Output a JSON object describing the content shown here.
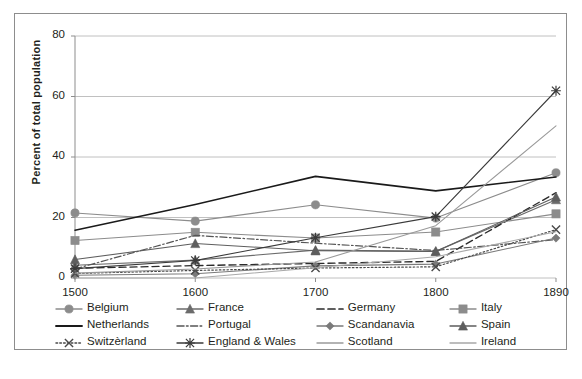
{
  "chart_data": {
    "type": "line",
    "title": "",
    "subtitle": "",
    "xlabel": "",
    "ylabel": "Percent of total population",
    "x": [
      1500,
      1600,
      1700,
      1800,
      1890
    ],
    "x_tick_labels": [
      "1500",
      "1600",
      "1700",
      "1800",
      "1890"
    ],
    "y_tick_labels": [
      "0",
      "20",
      "40",
      "60",
      "80"
    ],
    "y_ticks": [
      0,
      20,
      40,
      60,
      80
    ],
    "ylim": [
      0,
      80
    ],
    "grid": "horizontal",
    "legend_position": "bottom",
    "series": [
      {
        "name": "Belgium",
        "values": [
          21.5,
          18.8,
          24.2,
          19.8,
          34.8
        ],
        "color": "#8c8c8c",
        "marker": "circle",
        "dash": "solid",
        "width": 1.1
      },
      {
        "name": "France",
        "values": [
          4.2,
          5.9,
          9.2,
          8.8,
          25.9
        ],
        "color": "#6b6b6b",
        "marker": "triangle",
        "dash": "solid",
        "width": 1.1
      },
      {
        "name": "Germany",
        "values": [
          3.2,
          4.1,
          4.8,
          5.5,
          28.2
        ],
        "color": "#2b2b2b",
        "marker": "none",
        "dash": "dashed",
        "width": 1.4
      },
      {
        "name": "Italy",
        "values": [
          12.4,
          15.1,
          13.2,
          15.2,
          21.2
        ],
        "color": "#8c8c8c",
        "marker": "square",
        "dash": "solid",
        "width": 1.1
      },
      {
        "name": "Netherlands",
        "values": [
          15.8,
          24.3,
          33.6,
          28.8,
          33.4
        ],
        "color": "#1a1a1a",
        "marker": "none",
        "dash": "solid",
        "width": 1.6
      },
      {
        "name": "Portugal",
        "values": [
          3.0,
          14.1,
          11.5,
          9.1,
          12.7
        ],
        "color": "#555555",
        "marker": "none",
        "dash": "dashdot",
        "width": 1.2
      },
      {
        "name": "Scandanavia",
        "values": [
          0.9,
          1.4,
          4.0,
          4.6,
          13.2
        ],
        "color": "#7a7a7a",
        "marker": "diamond",
        "dash": "solid",
        "width": 1.1
      },
      {
        "name": "Spain",
        "values": [
          6.1,
          11.4,
          9.0,
          8.8,
          26.8
        ],
        "color": "#5e5e5e",
        "marker": "triangle",
        "dash": "solid",
        "width": 1.1
      },
      {
        "name": "Switzèrland",
        "values": [
          1.5,
          2.5,
          3.3,
          3.7,
          16.0
        ],
        "color": "#4a4a4a",
        "marker": "x",
        "dash": "dotted",
        "width": 1.2
      },
      {
        "name": "England & Wales",
        "values": [
          3.1,
          5.8,
          13.3,
          20.3,
          61.9
        ],
        "color": "#3a3a3a",
        "marker": "star",
        "dash": "solid",
        "width": 1.1
      },
      {
        "name": "Scotland",
        "values": [
          1.6,
          3.0,
          5.3,
          17.3,
          50.3
        ],
        "color": "#9a9a9a",
        "marker": "none",
        "dash": "solid",
        "width": 1.1
      },
      {
        "name": "Ireland",
        "values": [
          0.0,
          0.0,
          3.4,
          7.0,
          15.3
        ],
        "color": "#a8a8a8",
        "marker": "none",
        "dash": "solid",
        "width": 1.1
      }
    ]
  },
  "axis": {
    "y_title": "Percent of total population"
  },
  "legend": {
    "items": [
      {
        "label": "Belgium"
      },
      {
        "label": "France"
      },
      {
        "label": "Germany"
      },
      {
        "label": "Italy"
      },
      {
        "label": "Netherlands"
      },
      {
        "label": "Portugal"
      },
      {
        "label": "Scandanavia"
      },
      {
        "label": "Spain"
      },
      {
        "label": "Switzèrland"
      },
      {
        "label": "England & Wales"
      },
      {
        "label": "Scotland"
      },
      {
        "label": "Ireland"
      }
    ]
  },
  "colors": {
    "frame": "#8d8d8d",
    "gridline": "#b9b9b9",
    "text": "#231f20",
    "background": "#ffffff"
  }
}
